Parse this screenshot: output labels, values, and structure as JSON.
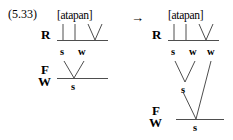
{
  "figure": {
    "example_number": "(5.33)",
    "arrow": "→",
    "notation_system": "metrical grid and tree",
    "stroke_color": "#3a3a3a",
    "text_color": "#000000",
    "background_color": "#ffffff"
  },
  "left_structure": {
    "surface_form": "[atapan]",
    "tiers": [
      {
        "label": "R",
        "name": "rhyme-tier"
      },
      {
        "label": "F",
        "name": "foot-tier"
      },
      {
        "label": "W",
        "name": "word-tier"
      }
    ],
    "foot_word_label_top": "F",
    "foot_word_label_bottom": "W",
    "rhyme_tier_label": "R",
    "rhyme_grid_marks": [
      "s",
      "w"
    ],
    "foot_grid_marks": [
      "s"
    ],
    "rhyme_branch_count": 3
  },
  "right_structure": {
    "surface_form": "[atapan]",
    "tiers": [
      {
        "label": "R",
        "name": "rhyme-tier"
      },
      {
        "label": "F",
        "name": "foot-tier"
      },
      {
        "label": "W",
        "name": "word-tier"
      }
    ],
    "foot_word_label_top": "F",
    "foot_word_label_bottom": "W",
    "rhyme_tier_label": "R",
    "rhyme_grid_marks": [
      "s",
      "w",
      "w"
    ],
    "intermediate_grid_marks": [
      "s"
    ],
    "foot_grid_marks": [
      "s"
    ],
    "rhyme_branch_count": 3
  }
}
